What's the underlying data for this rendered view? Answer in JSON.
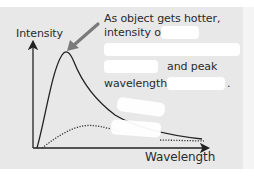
{
  "diagram": {
    "y_axis_label": "Intensity",
    "x_axis_label": "Wavelength",
    "caption": {
      "line1": "As object gets hotter,",
      "line2_prefix": "intensity of",
      "line4_suffix": "and peak",
      "line5_prefix": "wavelength",
      "line5_suffix": "."
    },
    "blanks": [
      {
        "id": "blank-intensity-of"
      },
      {
        "id": "blank-line3"
      },
      {
        "id": "blank-line4"
      },
      {
        "id": "blank-wavelength"
      },
      {
        "id": "blank-curve-label-1"
      },
      {
        "id": "blank-curve-label-2"
      }
    ],
    "curves": [
      {
        "name": "hotter object",
        "style": "solid",
        "peak": "short wavelength, high intensity"
      },
      {
        "name": "cooler object",
        "style": "dotted",
        "peak": "longer wavelength, low intensity"
      }
    ],
    "colors": {
      "panel": "#e8e8e8",
      "arrow": "#7a7a7a",
      "line": "#222222",
      "blank": "#ffffff"
    }
  }
}
